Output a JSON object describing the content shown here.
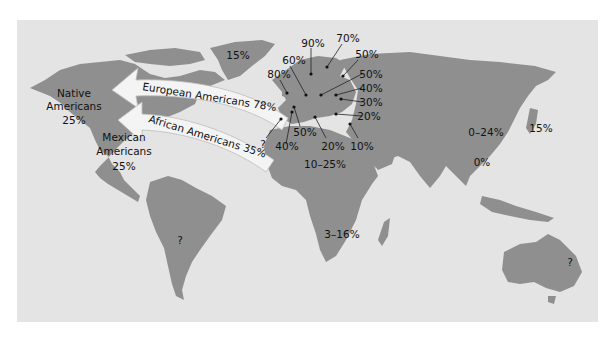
{
  "map": {
    "background_color": "#e4e4e4",
    "land_color": "#8f8f8f",
    "arrow_color": "#f4f4f4"
  },
  "arrows": {
    "european": "European Americans 78%",
    "african": "African Americans 35%"
  },
  "regions": {
    "native_americans": [
      "Native",
      "Americans",
      "25%"
    ],
    "mexican_americans": [
      "Mexican",
      "Americans",
      "25%"
    ],
    "greenland": "15%",
    "south_america": "?",
    "north_africa": "10–25%",
    "southern_africa": "3–16%",
    "china": "0–24%",
    "japan": "15%",
    "southeast_asia": "0%",
    "australia": "?"
  },
  "europe_points": [
    {
      "label": "90%"
    },
    {
      "label": "70%"
    },
    {
      "label": "60%"
    },
    {
      "label": "80%"
    },
    {
      "label": "50%"
    },
    {
      "label": "50%"
    },
    {
      "label": "40%"
    },
    {
      "label": "30%"
    },
    {
      "label": "20%"
    },
    {
      "label": "?"
    },
    {
      "label": "40%"
    },
    {
      "label": "50%"
    },
    {
      "label": "20%"
    },
    {
      "label": "10%"
    }
  ]
}
